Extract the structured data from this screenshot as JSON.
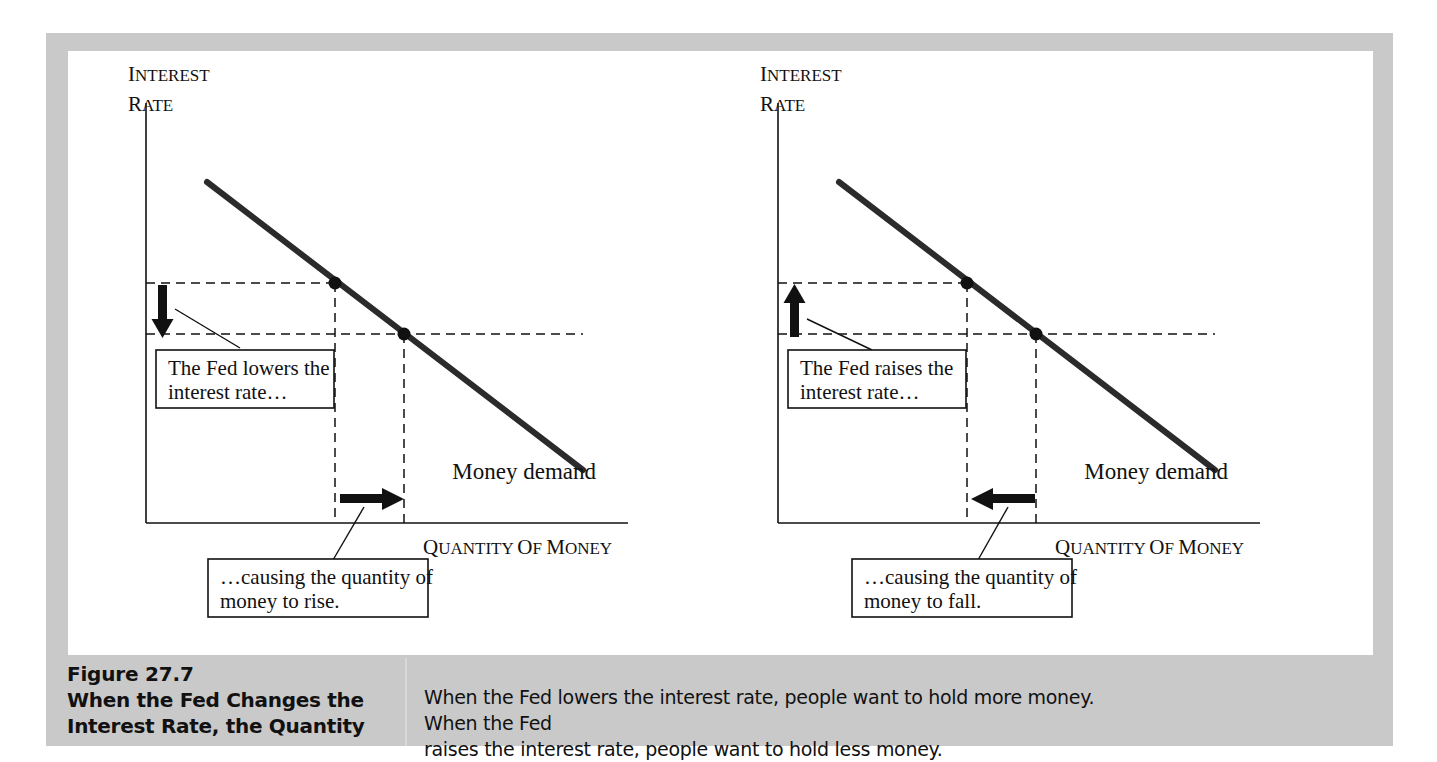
{
  "figure": {
    "number": "Figure 27.7",
    "title_line1": "When the Fed Changes the",
    "title_line2": "Interest Rate, the Quantity",
    "caption_line1": "When the Fed lowers the interest rate, people want to hold more money. When the Fed",
    "caption_line2": "raises the interest rate, people want to hold less money."
  },
  "axes": {
    "y_label_line1": "Interest",
    "y_label_line2": "Rate",
    "x_label": "Quantity of Money"
  },
  "curve": {
    "label": "Money demand",
    "color": "#2b2b2b"
  },
  "panels": [
    {
      "id": "lower-rate",
      "rate_callout_line1": "The Fed lowers the",
      "rate_callout_line2": "interest rate…",
      "quantity_callout_line1": "…causing the quantity of",
      "quantity_callout_line2": "money to rise.",
      "rate_arrow_direction": "down",
      "quantity_arrow_direction": "right"
    },
    {
      "id": "raise-rate",
      "rate_callout_line1": "The Fed raises the",
      "rate_callout_line2": "interest rate…",
      "quantity_callout_line1": "…causing the quantity of",
      "quantity_callout_line2": "money to fall.",
      "rate_arrow_direction": "up",
      "quantity_arrow_direction": "left"
    }
  ],
  "chart_data": {
    "type": "line",
    "xlabel": "Quantity of Money",
    "ylabel": "Interest Rate",
    "grid": false,
    "legend": "none",
    "series": [
      {
        "name": "Money demand",
        "description": "Downward-sloping money demand curve",
        "x": [
          0.16,
          1.0
        ],
        "y": [
          0.93,
          0.12
        ]
      }
    ],
    "points": [
      {
        "name": "initial-equilibrium",
        "x": 0.43,
        "y": 0.7,
        "label": ""
      },
      {
        "name": "new-equilibrium",
        "x": 0.58,
        "y": 0.555,
        "label": ""
      }
    ],
    "annotations": [
      {
        "name": "rate-level-high",
        "type": "dashed-horizontal",
        "y": 0.7
      },
      {
        "name": "rate-level-low",
        "type": "dashed-horizontal",
        "y": 0.555
      },
      {
        "name": "quantity-level-low",
        "type": "dashed-vertical",
        "x": 0.43
      },
      {
        "name": "quantity-level-high",
        "type": "dashed-vertical",
        "x": 0.58
      }
    ],
    "xlim": [
      0,
      1
    ],
    "ylim": [
      0,
      1
    ]
  }
}
